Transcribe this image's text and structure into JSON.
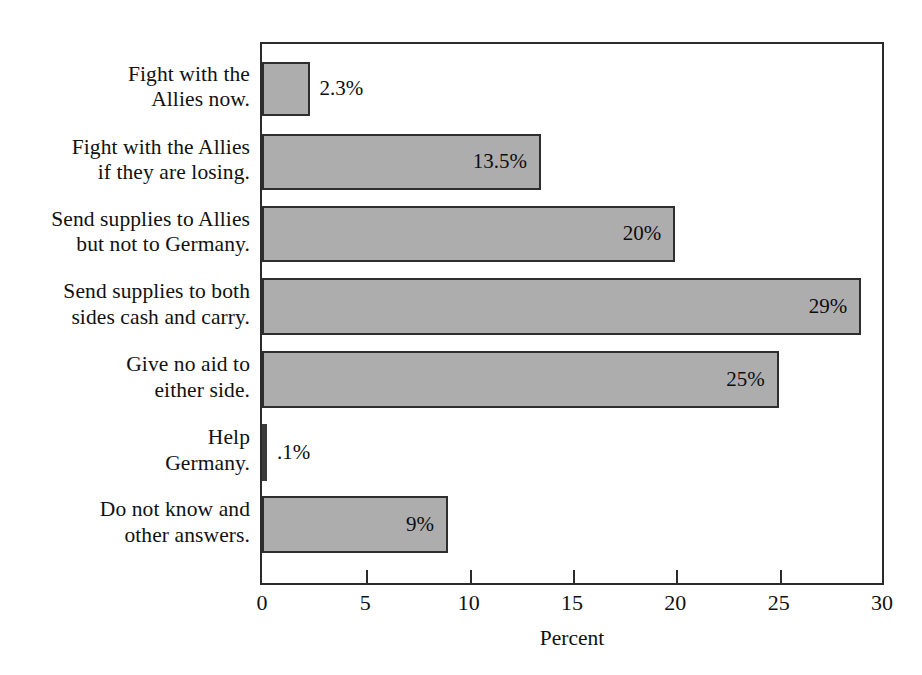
{
  "chart_data": {
    "type": "bar",
    "orientation": "horizontal",
    "title": "",
    "xlabel": "Percent",
    "ylabel": "",
    "xlim": [
      0,
      30
    ],
    "xticks": [
      0,
      5,
      10,
      15,
      20,
      25,
      30
    ],
    "xtick_labels": [
      "0",
      "5",
      "10",
      "15",
      "20",
      "25",
      "30"
    ],
    "grid": false,
    "legend": null,
    "bar_color": "#adadad",
    "bar_edge_color": "#2e2e2e",
    "categories": [
      "Fight with the Allies now.",
      "Fight with the Allies if they are losing.",
      "Send supplies to Allies but not to Germany.",
      "Send supplies to both sides cash and carry.",
      "Give no aid to either side.",
      "Help Germany.",
      "Do not know and other answers."
    ],
    "values": [
      2.3,
      13.5,
      20,
      29,
      25,
      0.1,
      9
    ],
    "data_labels": [
      "2.3%",
      "13.5%",
      "20%",
      "29%",
      "25%",
      ".1%",
      "9%"
    ]
  },
  "category_labels": [
    {
      "lines": [
        "Fight with the",
        "Allies now."
      ]
    },
    {
      "lines": [
        "Fight with the Allies",
        "if they are losing."
      ]
    },
    {
      "lines": [
        "Send supplies to Allies",
        "but not to Germany."
      ]
    },
    {
      "lines": [
        "Send supplies to both",
        "sides cash and carry."
      ]
    },
    {
      "lines": [
        "Give no aid to",
        "either side."
      ]
    },
    {
      "lines": [
        "Help",
        "Germany."
      ]
    },
    {
      "lines": [
        "Do not know and",
        "other answers."
      ]
    }
  ],
  "axis": {
    "x_title": "Percent",
    "tick_labels": [
      "0",
      "5",
      "10",
      "15",
      "20",
      "25",
      "30"
    ]
  }
}
